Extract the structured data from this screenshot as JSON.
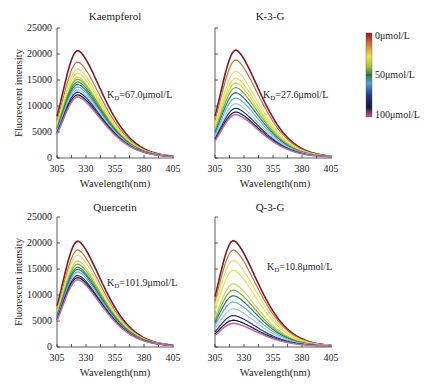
{
  "chart_data": [
    {
      "type": "line",
      "title": "Kaempferol",
      "xlabel": "Wavelength(nm)",
      "ylabel": "Fluorescent intensity",
      "xlim": [
        305,
        405
      ],
      "ylim": [
        0,
        25000
      ],
      "xticks": [
        305,
        330,
        355,
        380,
        405
      ],
      "yticks": [
        0,
        5000,
        10000,
        15000,
        20000,
        25000
      ],
      "annotation": "KD=67.0μmol/L",
      "peak_wavelength": 323,
      "series_peaks": [
        20500,
        18300,
        17000,
        16200,
        15400,
        15000,
        14500,
        14000,
        13500,
        13000,
        12500,
        12000,
        11600
      ]
    },
    {
      "type": "line",
      "title": "K-3-G",
      "xlabel": "Wavelength(nm)",
      "ylabel": "",
      "xlim": [
        305,
        405
      ],
      "ylim": [
        0,
        25000
      ],
      "xticks": [
        305,
        330,
        355,
        380,
        405
      ],
      "yticks": [
        0,
        5000,
        10000,
        15000,
        20000,
        25000
      ],
      "annotation": "KD=27.6μmol/L",
      "peak_wavelength": 323,
      "series_peaks": [
        20600,
        18700,
        16500,
        15200,
        14300,
        13400,
        12400,
        11400,
        10300,
        9400,
        8700,
        8200
      ]
    },
    {
      "type": "line",
      "title": "Quercetin",
      "xlabel": "Wavelength(nm)",
      "ylabel": "Fluorescent intensity",
      "xlim": [
        305,
        405
      ],
      "ylim": [
        0,
        25000
      ],
      "xticks": [
        305,
        330,
        355,
        380,
        405
      ],
      "yticks": [
        0,
        5000,
        10000,
        15000,
        20000,
        25000
      ],
      "annotation": "KD=101.9μmol/L",
      "peak_wavelength": 323,
      "series_peaks": [
        20200,
        18500,
        17500,
        16400,
        15800,
        15200,
        14800,
        14300,
        13600,
        13200,
        12800
      ]
    },
    {
      "type": "line",
      "title": "Q-3-G",
      "xlabel": "Wavelength(nm)",
      "ylabel": "",
      "xlim": [
        305,
        405
      ],
      "ylim": [
        0,
        25000
      ],
      "xticks": [
        305,
        330,
        355,
        380,
        405
      ],
      "yticks": [
        0,
        5000,
        10000,
        15000,
        20000,
        25000
      ],
      "annotation": "KD=10.8μmol/L",
      "peak_wavelength": 321,
      "series_peaks": [
        20300,
        18500,
        16500,
        14600,
        12000,
        10800,
        9700,
        8500,
        7200,
        5900,
        5000,
        4400
      ]
    }
  ],
  "legend": {
    "type": "colorbar",
    "labels": [
      "0μmol/L",
      "50μmol/L",
      "100μmol/L"
    ],
    "colors": [
      "#8b1a1a",
      "#c8703a",
      "#e8d040",
      "#f2ef70",
      "#7cae3e",
      "#2e7d4a",
      "#5aa0c8",
      "#24357a",
      "#101840",
      "#7a3a7a",
      "#c06090"
    ]
  },
  "series_colors": [
    "#7a1a2a",
    "#b07a3a",
    "#e8d87a",
    "#e8e040",
    "#c8d850",
    "#7aae40",
    "#3e8a4a",
    "#2a7a5a",
    "#6aaad0",
    "#9ac8e0",
    "#1a3a7a",
    "#101840",
    "#c070a0"
  ],
  "text": {
    "xlabel": "Wavelength(nm)",
    "ylabel": "Fluorescent intensity",
    "kd_prefix": "K",
    "kd_sub": "D",
    "panels": [
      {
        "title": "Kaempferol",
        "kd": "=67.0μmol/L"
      },
      {
        "title": "K-3-G",
        "kd": "=27.6μmol/L"
      },
      {
        "title": "Quercetin",
        "kd": "=101.9μmol/L"
      },
      {
        "title": "Q-3-G",
        "kd": "=10.8μmol/L"
      }
    ],
    "yticks": [
      "25000",
      "20000",
      "15000",
      "10000",
      "5000",
      "0"
    ],
    "xticks": [
      "305",
      "330",
      "355",
      "380",
      "405"
    ],
    "colorbar": [
      "0μmol/L",
      "50μmol/L",
      "100μmol/L"
    ]
  }
}
